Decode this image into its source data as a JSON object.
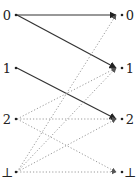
{
  "diagram": {
    "left_nodes": [
      {
        "id": "0",
        "label": "0",
        "y": 15
      },
      {
        "id": "1",
        "label": "1",
        "y": 68
      },
      {
        "id": "2",
        "label": "2",
        "y": 119
      },
      {
        "id": "bot",
        "label": "⊥",
        "y": 172
      }
    ],
    "right_nodes": [
      {
        "id": "0",
        "label": "0",
        "y": 15
      },
      {
        "id": "1",
        "label": "1",
        "y": 68
      },
      {
        "id": "2",
        "label": "2",
        "y": 119
      },
      {
        "id": "bot",
        "label": "⊥",
        "y": 172
      }
    ],
    "edges": [
      {
        "from": "0",
        "to": "0",
        "style": "solid"
      },
      {
        "from": "0",
        "to": "1",
        "style": "solid"
      },
      {
        "from": "1",
        "to": "2",
        "style": "solid"
      },
      {
        "from": "2",
        "to": "1",
        "style": "dotted"
      },
      {
        "from": "2",
        "to": "2",
        "style": "dotted"
      },
      {
        "from": "2",
        "to": "bot",
        "style": "dotted"
      },
      {
        "from": "bot",
        "to": "0",
        "style": "dotted"
      },
      {
        "from": "bot",
        "to": "1",
        "style": "dotted"
      },
      {
        "from": "bot",
        "to": "2",
        "style": "dotted"
      },
      {
        "from": "bot",
        "to": "bot",
        "style": "dotted"
      }
    ],
    "colors": {
      "solid": "#333333",
      "dotted": "#9a9a9a",
      "text": "#222222"
    }
  }
}
